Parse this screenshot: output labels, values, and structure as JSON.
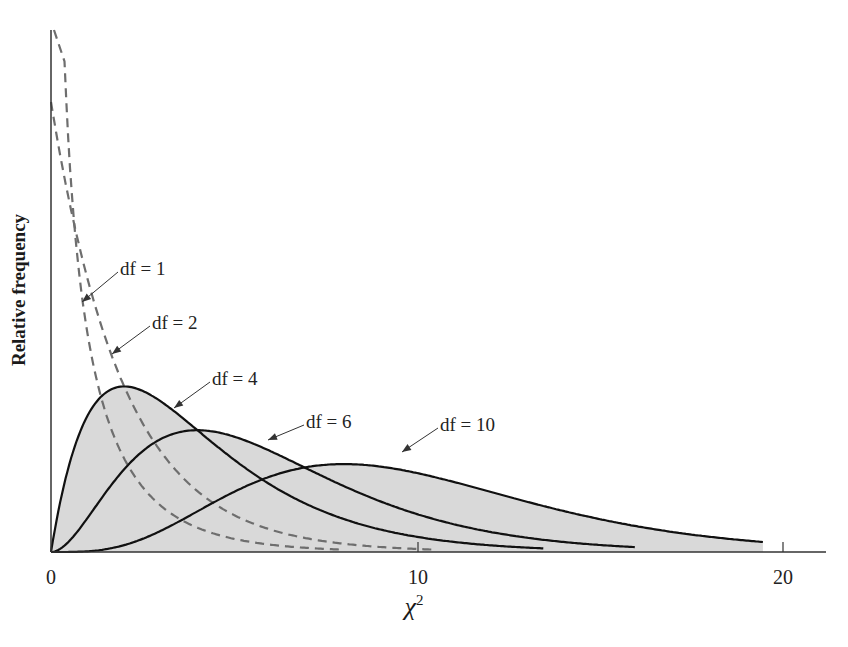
{
  "chart_data": {
    "type": "line",
    "title": "",
    "xlabel": "χ²",
    "xlabel_base": "χ",
    "xlabel_sup": "2",
    "ylabel": "Relative frequency",
    "xlim": [
      0,
      21
    ],
    "x_ticks": [
      0,
      10,
      20
    ],
    "x_tick_labels": [
      "0",
      "10",
      "20"
    ],
    "y_ticks": [],
    "grid": false,
    "legend": "none (inline arrow annotations)",
    "series": [
      {
        "name": "df = 1",
        "df": 1,
        "style": "dashed",
        "color": "#6e6e6e",
        "filled": false
      },
      {
        "name": "df = 2",
        "df": 2,
        "style": "dashed",
        "color": "#6e6e6e",
        "filled": false
      },
      {
        "name": "df = 4",
        "df": 4,
        "style": "solid",
        "color": "#111111",
        "filled": true,
        "peak_x": 2
      },
      {
        "name": "df = 6",
        "df": 6,
        "style": "solid",
        "color": "#111111",
        "filled": true,
        "peak_x": 4
      },
      {
        "name": "df = 10",
        "df": 10,
        "style": "solid",
        "color": "#111111",
        "filled": true,
        "peak_x": 8
      }
    ],
    "fill_color": "#d9d9d9",
    "annotations": [
      {
        "text": "df = 1",
        "label_x": 120,
        "label_y": 258,
        "arrow_to": [
          82,
          302
        ]
      },
      {
        "text": "df = 2",
        "label_x": 152,
        "label_y": 312,
        "arrow_to": [
          112,
          354
        ]
      },
      {
        "text": "df = 4",
        "label_x": 212,
        "label_y": 368,
        "arrow_to": [
          174,
          408
        ]
      },
      {
        "text": "df = 6",
        "label_x": 306,
        "label_y": 411,
        "arrow_to": [
          268,
          440
        ]
      },
      {
        "text": "df = 10",
        "label_x": 440,
        "label_y": 414,
        "arrow_to": [
          402,
          452
        ]
      }
    ]
  },
  "labels": {
    "ylabel": "Relative frequency",
    "xlabel_base": "χ",
    "xlabel_sup": "2",
    "ticks": [
      "0",
      "10",
      "20"
    ],
    "ann": [
      "df = 1",
      "df = 2",
      "df = 4",
      "df = 6",
      "df = 10"
    ]
  }
}
